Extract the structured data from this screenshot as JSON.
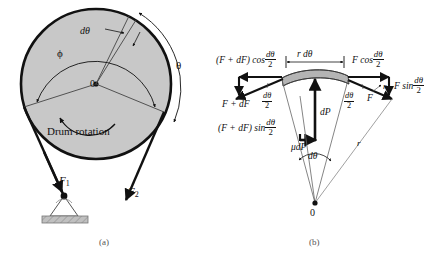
{
  "figure": {
    "background_color": "#ffffff",
    "drum_fill_color": "#c8c8c8",
    "band_fill_color": "#b4b4b4",
    "line_color": "#111111"
  },
  "panel_a": {
    "caption": "(a)",
    "center_label": "0",
    "angle_phi": "ϕ",
    "angle_theta": "θ",
    "element_angle": "dθ",
    "rotation_label": "Drum rotation",
    "force_1": "F",
    "force_1_sub": "1",
    "force_2": "F",
    "force_2_sub": "2"
  },
  "panel_b": {
    "caption": "(b)",
    "center_label": "0",
    "arc_length_label": "r dθ",
    "left_force": "F + dF",
    "right_force": "F",
    "left_cos_prefix": "(F + dF) cos",
    "left_sin_prefix": "(F + dF) sin",
    "right_cos_prefix": "F cos",
    "right_sin_prefix": "F sin",
    "half_angle_num": "dθ",
    "half_angle_den": "2",
    "normal_force": "dP",
    "friction_force": "μdP",
    "delta_angle": "dθ",
    "radius_label_left": "r",
    "radius_label_right": "r"
  }
}
